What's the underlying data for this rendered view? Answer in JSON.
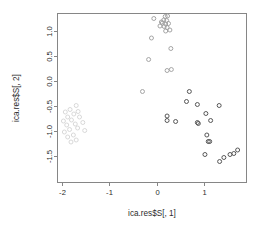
{
  "chart_data": {
    "type": "scatter",
    "title": "",
    "xlabel": "ica.res$S[, 1]",
    "ylabel": "ica.res$S[, 2]",
    "xticks": [
      -2,
      -1,
      0,
      1
    ],
    "yticks": [
      1.0,
      0.5,
      0.0,
      -0.5,
      -1.0,
      -1.5
    ],
    "xticklabels": [
      "-2",
      "-1",
      "0",
      "1"
    ],
    "yticklabels": [
      "1.0",
      "0.5",
      "0.0",
      "-0.5",
      "-1.0",
      "-1.5"
    ],
    "xlim": [
      -2.22,
      1.88
    ],
    "ylim": [
      -1.72,
      1.36
    ],
    "grid": false,
    "legend": null,
    "marker": "open-circle",
    "marker_size": 4,
    "series": [
      {
        "name": "cluster-left",
        "color": "#d6d6d6",
        "points": [
          [
            -1.93,
            -0.62
          ],
          [
            -1.83,
            -0.57
          ],
          [
            -1.7,
            -0.49
          ],
          [
            -1.88,
            -0.72
          ],
          [
            -1.75,
            -0.66
          ],
          [
            -1.66,
            -0.61
          ],
          [
            -1.97,
            -0.8
          ],
          [
            -1.8,
            -0.78
          ],
          [
            -1.63,
            -0.72
          ],
          [
            -1.9,
            -0.88
          ],
          [
            -1.72,
            -0.86
          ],
          [
            -1.56,
            -0.83
          ],
          [
            -1.95,
            -1.02
          ],
          [
            -1.84,
            -0.97
          ],
          [
            -1.67,
            -0.94
          ],
          [
            -1.52,
            -0.99
          ],
          [
            -1.88,
            -1.12
          ],
          [
            -1.76,
            -1.08
          ],
          [
            -1.7,
            -1.18
          ],
          [
            -1.81,
            -1.22
          ]
        ]
      },
      {
        "name": "cluster-top",
        "color": "#a0a0a0",
        "points": [
          [
            0.18,
            1.29
          ],
          [
            0.23,
            1.3
          ],
          [
            0.15,
            1.22
          ],
          [
            0.21,
            1.21
          ],
          [
            0.12,
            1.16
          ],
          [
            0.19,
            1.14
          ],
          [
            0.25,
            1.15
          ],
          [
            0.16,
            1.09
          ],
          [
            0.22,
            1.07
          ],
          [
            0.28,
            1.02
          ],
          [
            0.19,
            1.0
          ],
          [
            0.1,
            1.18
          ],
          [
            0.07,
            1.1
          ],
          [
            -0.06,
            1.25
          ],
          [
            -0.11,
            0.86
          ],
          [
            0.3,
            0.65
          ],
          [
            -0.17,
            0.43
          ],
          [
            0.22,
            0.21
          ],
          [
            0.31,
            0.23
          ],
          [
            -0.3,
            -0.21
          ]
        ]
      },
      {
        "name": "cluster-right",
        "color": "#4f4f4f",
        "points": [
          [
            0.69,
            -0.21
          ],
          [
            0.63,
            -0.41
          ],
          [
            0.86,
            -0.47
          ],
          [
            1.32,
            -0.49
          ],
          [
            1.04,
            -0.65
          ],
          [
            0.22,
            -0.7
          ],
          [
            0.22,
            -0.79
          ],
          [
            0.4,
            -0.81
          ],
          [
            0.86,
            -0.83
          ],
          [
            0.88,
            -0.85
          ],
          [
            1.14,
            -0.79
          ],
          [
            1.06,
            -1.08
          ],
          [
            1.09,
            -1.21
          ],
          [
            1.12,
            -1.21
          ],
          [
            1.02,
            -1.47
          ],
          [
            1.33,
            -1.61
          ],
          [
            1.55,
            -1.47
          ],
          [
            1.63,
            -1.45
          ],
          [
            1.71,
            -1.38
          ],
          [
            1.42,
            -1.53
          ]
        ]
      }
    ]
  },
  "axes": {
    "x_title": "ica.res$S[, 1]",
    "y_title": "ica.res$S[, 2]"
  }
}
